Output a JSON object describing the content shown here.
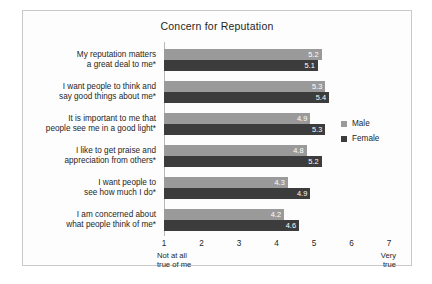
{
  "chart_data": {
    "type": "bar",
    "orientation": "horizontal",
    "title": "Concern for Reputation",
    "xlabel": "",
    "ylabel": "",
    "xlim": [
      1,
      7
    ],
    "xticks": [
      "1",
      "2",
      "3",
      "4",
      "5",
      "6",
      "7"
    ],
    "grid": false,
    "legend_position": "right",
    "axis_endpoint_labels": {
      "left": [
        "Not at all",
        "true of me"
      ],
      "right": [
        "Very",
        "true"
      ]
    },
    "categories": [
      [
        "My reputation matters",
        "a great deal to me*"
      ],
      [
        "I want people to think and",
        "say good things about me*"
      ],
      [
        "It is important to me that",
        "people see me in a good light*"
      ],
      [
        "I like to get praise and",
        "appreciation from others*"
      ],
      [
        "I want people to",
        "see how much I do*"
      ],
      [
        "I am concerned about",
        "what people think of me*"
      ]
    ],
    "series": [
      {
        "name": "Male",
        "color": "#9a9a9a",
        "values": [
          5.2,
          5.3,
          4.9,
          4.8,
          4.3,
          4.2
        ],
        "labels": [
          "5.2",
          "5.3",
          "4.9",
          "4.8",
          "4.3",
          "4.2"
        ]
      },
      {
        "name": "Female",
        "color": "#3c3c3c",
        "values": [
          5.1,
          5.4,
          5.3,
          5.2,
          4.9,
          4.6
        ],
        "labels": [
          "5.1",
          "5.4",
          "5.3",
          "5.2",
          "4.9",
          "4.6"
        ]
      }
    ]
  }
}
